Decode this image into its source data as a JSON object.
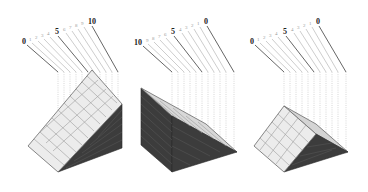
{
  "figure": {
    "panels": [
      {
        "id": "panel-1",
        "labels": [
          "0",
          "1",
          "2",
          "3",
          "4",
          "5",
          "6",
          "7",
          "8",
          "9",
          "10"
        ],
        "major_labels": [
          "0",
          "5",
          "10"
        ],
        "shape": "ascending-wedge"
      },
      {
        "id": "panel-2",
        "labels": [
          "10",
          "9",
          "8",
          "7",
          "6",
          "5",
          "4",
          "3",
          "2",
          "1",
          "0"
        ],
        "major_labels": [
          "10",
          "5",
          "0"
        ],
        "shape": "descending-wedge"
      },
      {
        "id": "panel-3",
        "labels": [
          "0",
          "1",
          "2",
          "3",
          "4",
          "5",
          "4",
          "3",
          "2",
          "1",
          "0"
        ],
        "major_labels": [
          "0",
          "5",
          "0"
        ],
        "shape": "symmetric-prism"
      }
    ]
  },
  "colors": {
    "light_face": "#ececec",
    "dark_face": "#3c3c3c",
    "leader": "#b8b8b8",
    "major_leader": "#555555"
  }
}
